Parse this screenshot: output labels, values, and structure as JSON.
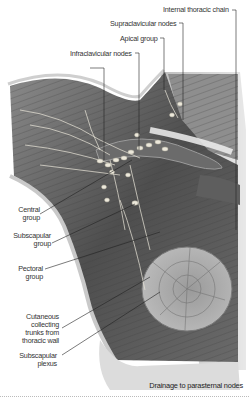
{
  "figure": {
    "labels_top": [
      {
        "id": "internal-thoracic-chain",
        "text": "Internal thoracic chain"
      },
      {
        "id": "supraclavicular-nodes",
        "text": "Supraclavicular nodes"
      },
      {
        "id": "apical-group",
        "text": "Apical group"
      },
      {
        "id": "infraclavicular-nodes",
        "text": "Infraclavicular nodes"
      }
    ],
    "labels_left": [
      {
        "id": "central-group",
        "line1": "Central",
        "line2": "group"
      },
      {
        "id": "subscapular-group",
        "line1": "Subscapular",
        "line2": "group"
      },
      {
        "id": "pectoral-group",
        "line1": "Pectoral",
        "line2": "group"
      },
      {
        "id": "cutaneous-trunks",
        "line1": "Cutaneous",
        "line2": "collecting",
        "line3": "trunks from",
        "line4": "thoracic wall"
      },
      {
        "id": "subscapular-plexus",
        "line1": "Subscapular",
        "line2": "plexus"
      }
    ],
    "caption": "Drainage to parasternal nodes",
    "colors": {
      "label_text": "#333333",
      "leader_line": "#222222",
      "muscle_dark": "#4a4a4a",
      "muscle_light": "#9a9a9a",
      "node": "#e6e2d6"
    }
  }
}
